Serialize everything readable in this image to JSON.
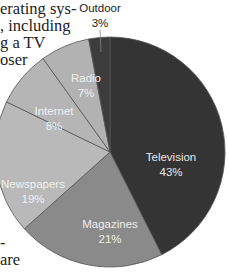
{
  "body_text": {
    "top_lines": [
      {
        "text": "erating sys-",
        "x": 0,
        "y": 0
      },
      {
        "text": ", including",
        "x": 0,
        "y": 17
      },
      {
        "text": "g a TV",
        "x": 0,
        "y": 34
      },
      {
        "text": "oser",
        "x": 0,
        "y": 51
      }
    ],
    "bottom_lines": [
      {
        "text": "-",
        "x": 0,
        "y": 234
      },
      {
        "text": "are",
        "x": 0,
        "y": 251
      }
    ]
  },
  "chart_data": {
    "type": "pie",
    "title": "",
    "categories": [
      "Television",
      "Magazines",
      "Newspapers",
      "Internet",
      "Radio",
      "Outdoor"
    ],
    "values": [
      43,
      21,
      19,
      8,
      7,
      3
    ],
    "labels": [
      "43%",
      "21%",
      "19%",
      "8%",
      "7%",
      "3%"
    ],
    "colors": [
      "#343434",
      "#8a8a8a",
      "#b9b9b9",
      "#b5b5b5",
      "#b2b2b2",
      "#3c3c3c"
    ],
    "label_colors": [
      "#e8e8e8",
      "#eeeeee",
      "#f0f0f0",
      "#f0f0f0",
      "#f0f0f0",
      "#222222"
    ],
    "start_angle_deg": 0,
    "direction": "clockwise",
    "center": [
      110,
      152
    ],
    "radius": 115,
    "divider_color": "#555555",
    "legend": "none",
    "outdoor_label_outside": true
  }
}
